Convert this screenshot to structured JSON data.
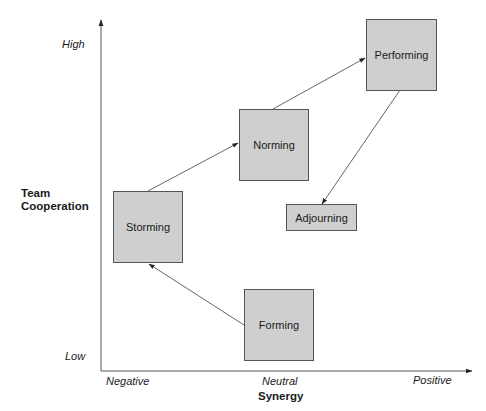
{
  "y_axis": {
    "title_line1": "Team",
    "title_line2": "Cooperation",
    "high_label": "High",
    "low_label": "Low"
  },
  "x_axis": {
    "title": "Synergy",
    "negative_label": "Negative",
    "neutral_label": "Neutral",
    "positive_label": "Positive"
  },
  "stages": {
    "forming": "Forming",
    "storming": "Storming",
    "norming": "Norming",
    "performing": "Performing",
    "adjourning": "Adjourning"
  },
  "flow": [
    {
      "from": "Forming",
      "to": "Storming"
    },
    {
      "from": "Storming",
      "to": "Norming"
    },
    {
      "from": "Norming",
      "to": "Performing"
    },
    {
      "from": "Performing",
      "to": "Adjourning"
    }
  ],
  "colors": {
    "box_fill": "#cfcfcf",
    "box_border": "#555555",
    "line": "#555555"
  }
}
